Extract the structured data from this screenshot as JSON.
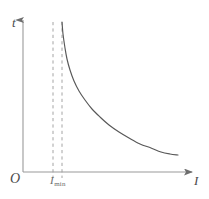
{
  "figure": {
    "name": "t-versus-I decay graph",
    "background_color": "#ffffff"
  },
  "labels": {
    "y_axis": "t",
    "x_axis": "I",
    "origin": "O",
    "threshold_symbol": "I",
    "threshold_subscript": "min"
  },
  "colors": {
    "axis": "#9a9a9a",
    "curve": "#585858",
    "dashed": "#9a9a9a",
    "text": "#4a4a4a"
  },
  "chart_data": {
    "type": "line",
    "title": "",
    "xlabel": "I",
    "ylabel": "t",
    "grid": false,
    "legend": false,
    "axis_arrows": {
      "x": "right",
      "y": "up"
    },
    "origin_label": "O",
    "xlim": [
      0,
      209
    ],
    "ylim": [
      0,
      199
    ],
    "annotations": [
      {
        "name": "asymptote-outer",
        "type": "vertical-dashed-line",
        "x": 53,
        "y_top": 22,
        "y_bottom": 178
      },
      {
        "name": "asymptote-inner",
        "type": "vertical-dashed-line",
        "x": 62,
        "y_top": 22,
        "y_bottom": 178
      },
      {
        "name": "threshold-tick-label",
        "type": "text",
        "text": "I_min",
        "x": 56,
        "y": 182
      }
    ],
    "series": [
      {
        "name": "t(I)",
        "description": "Hyperbolic decay asymptotic to the vertical line at I = I_min and to the I axis",
        "points": [
          [
            62,
            22
          ],
          [
            63,
            34
          ],
          [
            65,
            48
          ],
          [
            67,
            59
          ],
          [
            70,
            70
          ],
          [
            74,
            81
          ],
          [
            79,
            91
          ],
          [
            85,
            100
          ],
          [
            92,
            109
          ],
          [
            100,
            117
          ],
          [
            109,
            125
          ],
          [
            119,
            132
          ],
          [
            129,
            138
          ],
          [
            140,
            144
          ],
          [
            151,
            148
          ],
          [
            161,
            152
          ],
          [
            170,
            154
          ],
          [
            178,
            155
          ]
        ]
      }
    ]
  }
}
